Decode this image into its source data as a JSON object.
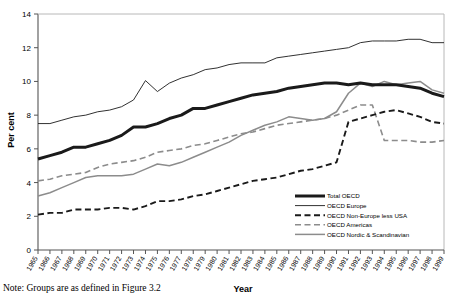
{
  "chart_data": {
    "type": "line",
    "title": "",
    "xlabel": "Year",
    "ylabel": "Per cent",
    "ylim": [
      0,
      14
    ],
    "yticks": [
      0,
      2,
      4,
      6,
      8,
      10,
      12,
      14
    ],
    "grid": false,
    "legend_position": "bottom-right",
    "x": [
      1965,
      1966,
      1967,
      1968,
      1969,
      1970,
      1971,
      1972,
      1973,
      1974,
      1975,
      1976,
      1977,
      1978,
      1979,
      1980,
      1981,
      1982,
      1983,
      1984,
      1985,
      1986,
      1987,
      1988,
      1989,
      1990,
      1991,
      1992,
      1993,
      1994,
      1995,
      1996,
      1997,
      1998,
      1999
    ],
    "categories": [
      "1965",
      "1966",
      "1967",
      "1968",
      "1969",
      "1970",
      "1971",
      "1972",
      "1973",
      "1974",
      "1975",
      "1976",
      "1977",
      "1978",
      "1979",
      "1980",
      "1981",
      "1982",
      "1983",
      "1984",
      "1985",
      "1986",
      "1987",
      "1988",
      "1989",
      "1990",
      "1991",
      "1992",
      "1993",
      "1994",
      "1995",
      "1996",
      "1997",
      "1998",
      "1999"
    ],
    "series": [
      {
        "name": "Total OECD",
        "style": "solid-thick-black",
        "color": "#1a1a1a",
        "values": [
          5.4,
          5.6,
          5.8,
          6.1,
          6.1,
          6.3,
          6.5,
          6.8,
          7.3,
          7.3,
          7.5,
          7.8,
          8.0,
          8.4,
          8.4,
          8.6,
          8.8,
          9.0,
          9.2,
          9.3,
          9.4,
          9.6,
          9.7,
          9.8,
          9.9,
          9.9,
          9.8,
          9.9,
          9.8,
          9.8,
          9.8,
          9.7,
          9.6,
          9.3,
          9.1
        ]
      },
      {
        "name": "OECD Europe",
        "style": "solid-thin-black",
        "color": "#1a1a1a",
        "values": [
          7.5,
          7.5,
          7.7,
          7.9,
          8.0,
          8.2,
          8.3,
          8.5,
          8.9,
          10.05,
          9.4,
          9.9,
          10.2,
          10.4,
          10.7,
          10.8,
          11.0,
          11.1,
          11.1,
          11.1,
          11.4,
          11.5,
          11.6,
          11.7,
          11.8,
          11.9,
          12.0,
          12.3,
          12.4,
          12.4,
          12.4,
          12.5,
          12.5,
          12.3,
          12.3
        ]
      },
      {
        "name": "OECD Non-Europe less USA",
        "style": "dashed-black",
        "color": "#1a1a1a",
        "values": [
          2.1,
          2.2,
          2.2,
          2.4,
          2.4,
          2.4,
          2.5,
          2.5,
          2.4,
          2.6,
          2.9,
          2.9,
          3.0,
          3.2,
          3.3,
          3.5,
          3.7,
          3.9,
          4.1,
          4.2,
          4.3,
          4.5,
          4.7,
          4.8,
          5.0,
          5.2,
          7.6,
          7.8,
          8.0,
          8.2,
          8.3,
          8.1,
          7.9,
          7.6,
          7.5
        ]
      },
      {
        "name": "OECD Americas",
        "style": "dashed-grey",
        "color": "#8c8c8c",
        "values": [
          4.1,
          4.2,
          4.4,
          4.5,
          4.6,
          4.9,
          5.1,
          5.2,
          5.3,
          5.5,
          5.8,
          5.9,
          6.0,
          6.2,
          6.3,
          6.5,
          6.7,
          6.9,
          7.0,
          7.2,
          7.4,
          7.5,
          7.6,
          7.7,
          7.8,
          8.0,
          8.3,
          8.6,
          8.6,
          6.5,
          6.5,
          6.5,
          6.4,
          6.4,
          6.5
        ]
      },
      {
        "name": "OECD Nordic & Scandinavian",
        "style": "solid-grey",
        "color": "#8c8c8c",
        "values": [
          3.2,
          3.4,
          3.7,
          4.0,
          4.3,
          4.4,
          4.4,
          4.4,
          4.5,
          4.8,
          5.1,
          5.0,
          5.2,
          5.5,
          5.8,
          6.1,
          6.4,
          6.8,
          7.1,
          7.4,
          7.6,
          7.9,
          7.8,
          7.7,
          7.8,
          8.2,
          9.3,
          9.9,
          9.7,
          10.0,
          9.8,
          9.9,
          10.0,
          9.5,
          9.3
        ]
      }
    ]
  },
  "legend": {
    "items": [
      {
        "label": "Total OECD",
        "swatch": "solid-thick-black"
      },
      {
        "label": "OECD Europe",
        "swatch": "solid-thin-black"
      },
      {
        "label": "OECD Non-Europe less USA",
        "swatch": "dashed-black"
      },
      {
        "label": "OECD Americas",
        "swatch": "dashed-grey"
      },
      {
        "label": "OECD Nordic & Scandinavian",
        "swatch": "solid-grey"
      }
    ]
  },
  "note": {
    "text": "Note: Groups are as defined in Figure 3.2"
  },
  "colors": {
    "black": "#1a1a1a",
    "grey": "#8c8c8c",
    "axis": "#555555",
    "background": "#ffffff"
  }
}
